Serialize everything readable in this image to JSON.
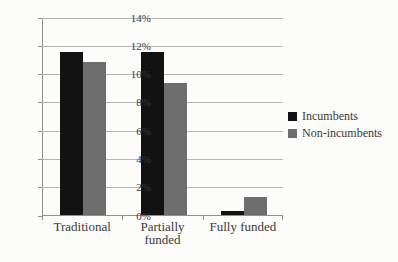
{
  "chart_data": {
    "type": "bar",
    "categories": [
      "Traditional",
      "Partially funded",
      "Fully funded"
    ],
    "series": [
      {
        "name": "Incumbents",
        "color": "#121212",
        "values": [
          11.5,
          11.5,
          0.3
        ]
      },
      {
        "name": "Non-incumbents",
        "color": "#6e6e6e",
        "values": [
          10.8,
          9.3,
          1.3
        ]
      }
    ],
    "title": "",
    "xlabel": "",
    "ylabel": "",
    "ylim": [
      0,
      14
    ],
    "ytick_step": 2,
    "ytick_labels": [
      "0%",
      "2%",
      "4%",
      "6%",
      "8%",
      "10%",
      "12%",
      "14%"
    ],
    "grid": true,
    "legend_position": "right",
    "colors": {
      "grid": "#b5b5b2",
      "axis": "#8f8f8c",
      "text": "#3a3a3a",
      "background": "#fcfcfa"
    }
  }
}
